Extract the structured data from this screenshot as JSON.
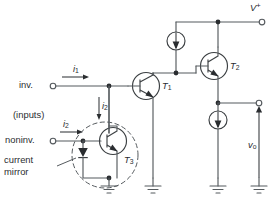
{
  "diagram": {
    "type": "circuit-schematic",
    "colors": {
      "wire": "#555a5e",
      "device": "#3b3f42",
      "text": "#2a2d30",
      "background": "#ffffff"
    }
  },
  "labels": {
    "supply_positive": "V",
    "supply_positive_sup": "+",
    "inverting_input": "inv.",
    "noninverting_input": "noninv.",
    "inputs_note": "(inputs)",
    "current_mirror": "current\nmirror",
    "current_mirror_line1": "current",
    "current_mirror_line2": "mirror",
    "output_voltage": "v",
    "output_voltage_sub": "o",
    "current_i1": "i",
    "current_i1_sub": "1",
    "current_i2_in": "i",
    "current_i2_in_sub": "2",
    "current_i2_down": "i",
    "current_i2_down_sub": "2",
    "transistor_t1": "T",
    "transistor_t1_sub": "1",
    "transistor_t2": "T",
    "transistor_t2_sub": "2",
    "transistor_t3": "T",
    "transistor_t3_sub": "3"
  },
  "components": [
    {
      "name": "transistor-t1",
      "kind": "npn-bjt",
      "label": "T1"
    },
    {
      "name": "transistor-t2",
      "kind": "npn-bjt",
      "label": "T2"
    },
    {
      "name": "transistor-t3",
      "kind": "npn-bjt",
      "label": "T3"
    },
    {
      "name": "current-source-upper",
      "kind": "current-source",
      "direction": "down"
    },
    {
      "name": "current-source-lower",
      "kind": "current-source",
      "direction": "down"
    },
    {
      "name": "diode-mirror",
      "kind": "diode",
      "direction": "down"
    },
    {
      "name": "ground-t3",
      "kind": "ground"
    },
    {
      "name": "ground-t1-emitter",
      "kind": "ground"
    },
    {
      "name": "ground-output-branch",
      "kind": "ground"
    },
    {
      "name": "ground-output-terminal",
      "kind": "ground"
    }
  ],
  "terminals": [
    {
      "name": "terminal-vplus",
      "label": "V+"
    },
    {
      "name": "terminal-inverting",
      "label": "inv."
    },
    {
      "name": "terminal-noninverting",
      "label": "noninv."
    },
    {
      "name": "terminal-output",
      "label": "vo"
    }
  ]
}
